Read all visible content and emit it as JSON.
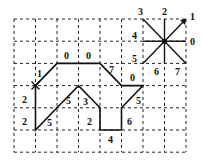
{
  "grid": {
    "origin_x": 14,
    "origin_y": 19,
    "cell_w": 21.5,
    "cell_h": 22.2,
    "cols": 8,
    "rows": 6
  },
  "chain_code": {
    "start": [
      1,
      3
    ],
    "start_marker": "x-mark",
    "codes": [
      1,
      0,
      0,
      7,
      0,
      5,
      6,
      4,
      2,
      3,
      5,
      5,
      2,
      2
    ],
    "labels": [
      {
        "text": "1",
        "x": 37,
        "y": 77
      },
      {
        "text": "0",
        "x": 64,
        "y": 59
      },
      {
        "text": "0",
        "x": 86,
        "y": 59
      },
      {
        "text": "7",
        "x": 109,
        "y": 73
      },
      {
        "text": "0",
        "x": 130,
        "y": 81
      },
      {
        "text": "5",
        "x": 136,
        "y": 104
      },
      {
        "text": "6",
        "x": 127,
        "y": 125
      },
      {
        "text": "4",
        "x": 108,
        "y": 143
      },
      {
        "text": "2",
        "x": 87,
        "y": 125
      },
      {
        "text": "3",
        "x": 83,
        "y": 105
      },
      {
        "text": "5",
        "x": 66,
        "y": 104
      },
      {
        "text": "5",
        "x": 47,
        "y": 126
      },
      {
        "text": "2",
        "x": 22,
        "y": 103
      },
      {
        "text": "2",
        "x": 22,
        "y": 125
      }
    ]
  },
  "direction_legend": {
    "center": [
      7,
      1
    ],
    "directions": [
      {
        "code": "0",
        "dx": 1,
        "dy": 0,
        "label_x": 190,
        "label_y": 45
      },
      {
        "code": "1",
        "dx": 1,
        "dy": -1,
        "label_x": 190,
        "label_y": 20
      },
      {
        "code": "2",
        "dx": 0,
        "dy": -1,
        "label_x": 162,
        "label_y": 15
      },
      {
        "code": "3",
        "dx": -1,
        "dy": -1,
        "label_x": 138,
        "label_y": 15
      },
      {
        "code": "4",
        "dx": -1,
        "dy": 0,
        "label_x": 132,
        "label_y": 39
      },
      {
        "code": "5",
        "dx": -1,
        "dy": 1,
        "label_x": 132,
        "label_y": 62
      },
      {
        "code": "6",
        "dx": 0,
        "dy": 1,
        "label_x": 154,
        "label_y": 75
      },
      {
        "code": "7",
        "dx": 1,
        "dy": 1,
        "label_x": 175,
        "label_y": 75
      }
    ]
  }
}
